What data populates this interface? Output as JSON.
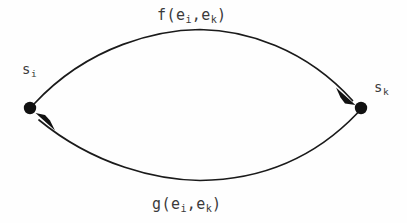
{
  "figure": {
    "type": "directed-graph-diagram",
    "background_color": "#fefefe",
    "ink_color": "#1a1a1a",
    "text_color": "#3a3a3a",
    "width": 407,
    "height": 223
  },
  "nodes": [
    {
      "id": "s_i",
      "label_base": "s",
      "label_subscript": "i",
      "x": 30,
      "y": 108,
      "radius": 6,
      "label_x": 22,
      "label_y": 62
    },
    {
      "id": "s_k",
      "label_base": "s",
      "label_subscript": "k",
      "x": 361,
      "y": 108,
      "radius": 6,
      "label_x": 374,
      "label_y": 80
    }
  ],
  "edges": [
    {
      "id": "edge-f",
      "from": "s_i",
      "to": "s_k",
      "direction": "left-to-right",
      "curve": "arc-above",
      "apex_y": 40,
      "label_base": "f",
      "label_open": "(",
      "label_arg1_base": "e",
      "label_arg1_sub": "i",
      "label_comma": ",",
      "label_arg2_base": "e",
      "label_arg2_sub": "k",
      "label_close": ")",
      "label_x": 157,
      "label_y": 8
    },
    {
      "id": "edge-g",
      "from": "s_k",
      "to": "s_i",
      "direction": "right-to-left",
      "curve": "arc-below",
      "apex_y": 179,
      "label_base": "g",
      "label_open": "(",
      "label_arg1_base": "e",
      "label_arg1_sub": "i",
      "label_comma": ",",
      "label_arg2_base": "e",
      "label_arg2_sub": "k",
      "label_close": ")",
      "label_x": 152,
      "label_y": 197
    }
  ]
}
